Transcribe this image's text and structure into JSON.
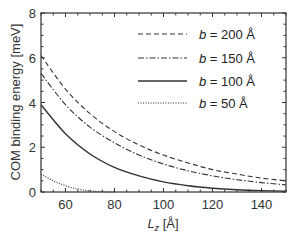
{
  "chart_data": {
    "type": "line",
    "title": "",
    "xlabel": "L_z [Å]",
    "ylabel": "COM binding energy [meV]",
    "xlim": [
      50,
      150
    ],
    "ylim": [
      0,
      8
    ],
    "xticks": [
      60,
      80,
      100,
      120,
      140
    ],
    "yticks": [
      0,
      2,
      4,
      6,
      8
    ],
    "grid": false,
    "legend_position": "upper right",
    "series": [
      {
        "name": "b = 200 Å",
        "style": "dashed",
        "x": [
          50,
          60,
          70,
          80,
          90,
          100,
          110,
          120,
          130,
          140,
          150
        ],
        "y": [
          6.1,
          4.6,
          3.5,
          2.7,
          2.1,
          1.65,
          1.3,
          1.0,
          0.8,
          0.62,
          0.5
        ]
      },
      {
        "name": "b = 150 Å",
        "style": "dashdot",
        "x": [
          50,
          60,
          70,
          80,
          90,
          100,
          110,
          120,
          130,
          140,
          150
        ],
        "y": [
          5.3,
          3.9,
          2.9,
          2.2,
          1.65,
          1.25,
          0.95,
          0.72,
          0.55,
          0.42,
          0.32
        ]
      },
      {
        "name": "b = 100 Å",
        "style": "solid",
        "x": [
          50,
          60,
          70,
          80,
          90,
          100,
          110,
          120,
          130,
          140,
          150
        ],
        "y": [
          3.9,
          2.6,
          1.7,
          1.1,
          0.72,
          0.45,
          0.28,
          0.17,
          0.1,
          0.06,
          0.04
        ]
      },
      {
        "name": "b = 50 Å",
        "style": "dotted",
        "x": [
          50,
          55,
          60,
          65,
          70,
          75,
          80
        ],
        "y": [
          0.8,
          0.5,
          0.28,
          0.13,
          0.05,
          0.01,
          0.0
        ]
      }
    ]
  },
  "labels": {
    "xlabel_main": "L",
    "xlabel_sub": "z",
    "xlabel_unit": " [Å]",
    "ylabel": "COM binding energy [meV]",
    "legend": [
      {
        "var": "b",
        "rest": " = 200 Å"
      },
      {
        "var": "b",
        "rest": " = 150 Å"
      },
      {
        "var": "b",
        "rest": " = 100 Å"
      },
      {
        "var": "b",
        "rest": " = 50 Å"
      }
    ]
  }
}
